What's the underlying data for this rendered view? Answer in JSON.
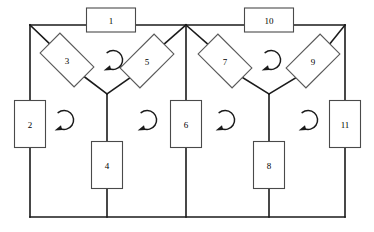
{
  "figure": {
    "type": "network-graph-diagram",
    "caption": "",
    "background_color": "#ffffff",
    "line_color": "#1a1a1a",
    "shape_stroke_color": "#4a4a4a"
  },
  "elements": [
    {
      "id": "1",
      "label": "1",
      "shape": "rectangle",
      "cx": 111,
      "cy": 20,
      "w": 49,
      "h": 24,
      "rotation": 0
    },
    {
      "id": "2",
      "label": "2",
      "shape": "rectangle",
      "cx": 30,
      "cy": 124,
      "w": 31,
      "h": 47,
      "rotation": 0
    },
    {
      "id": "3",
      "label": "3",
      "shape": "rectangle",
      "cx": 67,
      "cy": 60,
      "w": 48,
      "h": 28,
      "rotation": 45
    },
    {
      "id": "4",
      "label": "4",
      "shape": "rectangle",
      "cx": 107,
      "cy": 165,
      "w": 31,
      "h": 47,
      "rotation": 0
    },
    {
      "id": "5",
      "label": "5",
      "shape": "rectangle",
      "cx": 147,
      "cy": 61,
      "w": 48,
      "h": 28,
      "rotation": -45
    },
    {
      "id": "6",
      "label": "6",
      "shape": "rectangle",
      "cx": 186,
      "cy": 124,
      "w": 31,
      "h": 47,
      "rotation": 0
    },
    {
      "id": "7",
      "label": "7",
      "shape": "rectangle",
      "cx": 225,
      "cy": 61,
      "w": 48,
      "h": 28,
      "rotation": 45
    },
    {
      "id": "8",
      "label": "8",
      "shape": "rectangle",
      "cx": 269,
      "cy": 165,
      "w": 31,
      "h": 47,
      "rotation": 0
    },
    {
      "id": "9",
      "label": "9",
      "shape": "rectangle",
      "cx": 313,
      "cy": 61,
      "w": 48,
      "h": 28,
      "rotation": -45
    },
    {
      "id": "10",
      "label": "10",
      "shape": "rectangle",
      "cx": 269,
      "cy": 20,
      "w": 49,
      "h": 24,
      "rotation": 0
    },
    {
      "id": "11",
      "label": "11",
      "shape": "rectangle",
      "cx": 345,
      "cy": 124,
      "w": 31,
      "h": 47,
      "rotation": 0
    }
  ],
  "mesh_arrows": [
    {
      "id": "mesh-top-left",
      "cx": 113,
      "cy": 60,
      "direction": "counterclockwise"
    },
    {
      "id": "mesh-left",
      "cx": 64,
      "cy": 120,
      "direction": "counterclockwise"
    },
    {
      "id": "mesh-mid-left",
      "cx": 147,
      "cy": 120,
      "direction": "counterclockwise"
    },
    {
      "id": "mesh-mid-right",
      "cx": 225,
      "cy": 120,
      "direction": "counterclockwise"
    },
    {
      "id": "mesh-right",
      "cx": 308,
      "cy": 120,
      "direction": "counterclockwise"
    },
    {
      "id": "mesh-top-right",
      "cx": 271,
      "cy": 60,
      "direction": "counterclockwise"
    }
  ],
  "nodes": [
    {
      "id": "node-top-left",
      "x": 30,
      "y": 25
    },
    {
      "id": "node-top-mid",
      "x": 186,
      "y": 25
    },
    {
      "id": "node-top-right",
      "x": 345,
      "y": 25
    },
    {
      "id": "node-vertex-left",
      "x": 107,
      "y": 94
    },
    {
      "id": "node-vertex-right",
      "x": 269,
      "y": 94
    },
    {
      "id": "node-bot-left",
      "x": 30,
      "y": 217
    },
    {
      "id": "node-bot-4",
      "x": 107,
      "y": 217
    },
    {
      "id": "node-bot-6",
      "x": 186,
      "y": 217
    },
    {
      "id": "node-bot-8",
      "x": 269,
      "y": 217
    },
    {
      "id": "node-bot-right",
      "x": 345,
      "y": 217
    }
  ]
}
